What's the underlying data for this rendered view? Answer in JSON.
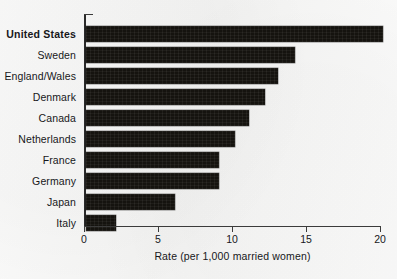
{
  "chart_data": {
    "type": "bar",
    "orientation": "horizontal",
    "title": "",
    "xlabel": "Rate (per 1,000 married women)",
    "ylabel": "",
    "xlim": [
      0,
      20
    ],
    "xticks": [
      "0",
      "5",
      "10",
      "15",
      "20"
    ],
    "xtick_values": [
      0,
      5,
      10,
      15,
      20
    ],
    "grid": false,
    "legend": null,
    "bar_color": "#15130f",
    "background_color": "#f6f6f5",
    "text_color": "#17171a",
    "emphasis_category": "United States",
    "categories": [
      "United States",
      "Sweden",
      "England/Wales",
      "Denmark",
      "Canada",
      "Netherlands",
      "France",
      "Germany",
      "Japan",
      "Italy"
    ],
    "values": [
      20.1,
      14.1,
      13.0,
      12.1,
      11.0,
      10.1,
      9.0,
      9.0,
      6.0,
      2.0
    ]
  },
  "axis": {
    "x_title": "Rate (per 1,000 married women)"
  },
  "source_note": ""
}
